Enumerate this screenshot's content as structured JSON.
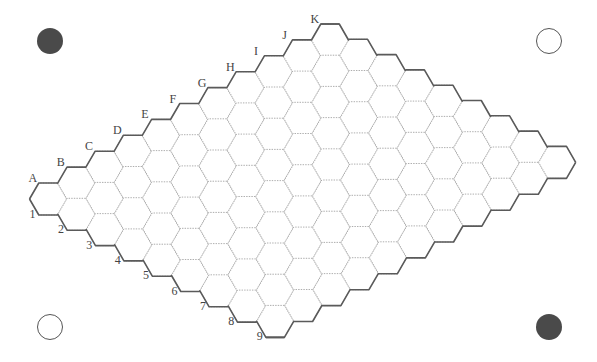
{
  "game": {
    "name": "Hex",
    "board": {
      "columns": [
        "A",
        "B",
        "C",
        "D",
        "E",
        "F",
        "G",
        "H",
        "I",
        "J",
        "K"
      ],
      "rows": [
        "1",
        "2",
        "3",
        "4",
        "5",
        "6",
        "7",
        "8",
        "9"
      ],
      "empty": true,
      "origin": [
        48,
        199
      ],
      "col_step": [
        28.2,
        -15.9
      ],
      "row_step": [
        28.4,
        15.3
      ],
      "hex_radius": 18.5,
      "hex_half_height": 16
    },
    "corner_markers": [
      {
        "position": "top-left",
        "x": 50,
        "y": 41,
        "style": "filled",
        "color": "#4a4a4a"
      },
      {
        "position": "top-right",
        "x": 549,
        "y": 41,
        "style": "hollow",
        "color": "#555555"
      },
      {
        "position": "bottom-left",
        "x": 50,
        "y": 327,
        "style": "hollow",
        "color": "#555555"
      },
      {
        "position": "bottom-right",
        "x": 549,
        "y": 327,
        "style": "filled",
        "color": "#4a4a4a"
      }
    ],
    "colors": {
      "background": "#ffffff",
      "grid_line": "#9a9a9a",
      "border_line": "#5a5a5a",
      "label": "#444444"
    }
  }
}
